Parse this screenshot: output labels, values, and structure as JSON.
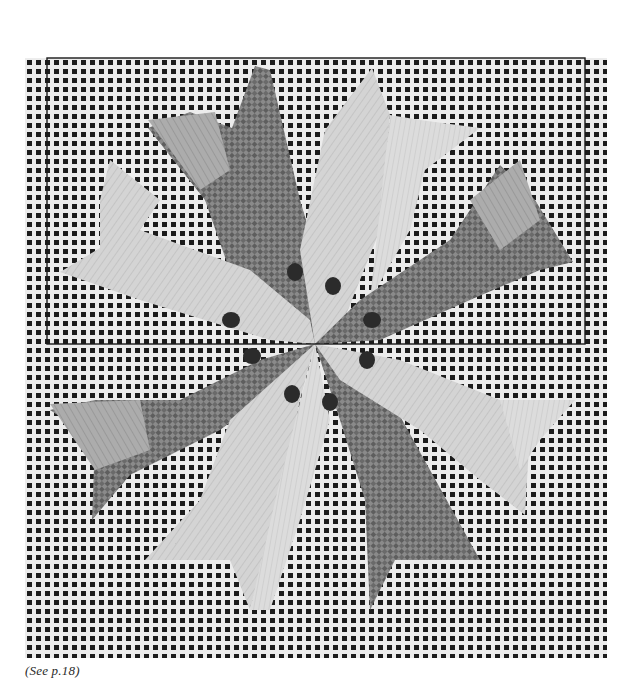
{
  "figure": {
    "caption": "(See p.18)",
    "colors": {
      "paper": "#ffffff",
      "canvas_thread": "#ececec",
      "mesh_hole": "#1c1c1c",
      "yarn_light": "#d2d2d2",
      "yarn_mid": "#a9a9a9",
      "yarn_dark": "#7a7a7a",
      "yarn_darkest": "#555555",
      "accent_dot": "#2b2b2b",
      "outline": "#1a1a1a"
    },
    "canvas_bounds": {
      "x": 25,
      "y": 58,
      "width": 582,
      "height": 600
    },
    "highlight_rectangle": {
      "x": 47,
      "y": 58,
      "width": 538,
      "height": 286
    },
    "star_center": {
      "x": 315,
      "y": 344
    }
  }
}
